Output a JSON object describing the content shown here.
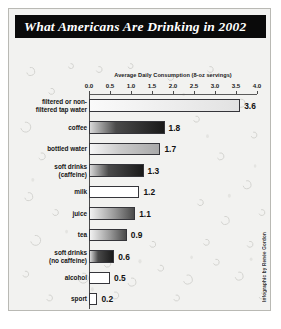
{
  "poster": {
    "title": "What Americans Are Drinking in 2002",
    "credit": "Infographic by Renée Gordon",
    "background_color": "#f2f2f0",
    "titlebar_color": "#0a0a0a",
    "title_text_color": "#ffffff"
  },
  "chart_data": {
    "type": "bar",
    "orientation": "horizontal",
    "title": "What Americans Are Drinking in 2002",
    "xlabel": "Average Daily Consumption (8-oz servings)",
    "ylabel": "",
    "xlim": [
      0.0,
      4.0
    ],
    "xticks": [
      "0.0",
      "0.5",
      "1.0",
      "1.5",
      "2.0",
      "2.5",
      "3.0",
      "3.5",
      "4.0"
    ],
    "grid": false,
    "legend": null,
    "categories": [
      "filtered or non-filtered tap water",
      "coffee",
      "bottled water",
      "soft drinks (caffeine)",
      "milk",
      "juice",
      "tea",
      "soft drinks (no caffeine)",
      "alcohol",
      "sport"
    ],
    "values": [
      3.6,
      1.8,
      1.7,
      1.3,
      1.2,
      1.1,
      0.9,
      0.6,
      0.5,
      0.2
    ],
    "value_labels": [
      "3.6",
      "1.8",
      "1.7",
      "1.3",
      "1.2",
      "1.1",
      "0.9",
      "0.6",
      "0.5",
      "0.2"
    ],
    "bars": [
      {
        "label": "filtered or non-filtered tap water",
        "label_lines": [
          "filtered or non-",
          "filtered tap water"
        ],
        "value": 3.6,
        "value_label": "3.6",
        "fill": "light",
        "height_px": 13
      },
      {
        "label": "coffee",
        "label_lines": [
          "coffee"
        ],
        "value": 1.8,
        "value_label": "1.8",
        "fill": "dark",
        "height_px": 13
      },
      {
        "label": "bottled water",
        "label_lines": [
          "bottled water"
        ],
        "value": 1.7,
        "value_label": "1.7",
        "fill": "medium",
        "height_px": 12
      },
      {
        "label": "soft drinks (caffeine)",
        "label_lines": [
          "soft drinks",
          "(caffeine)"
        ],
        "value": 1.3,
        "value_label": "1.3",
        "fill": "dark",
        "height_px": 13
      },
      {
        "label": "milk",
        "label_lines": [
          "milk"
        ],
        "value": 1.2,
        "value_label": "1.2",
        "fill": "white",
        "height_px": 12
      },
      {
        "label": "juice",
        "label_lines": [
          "juice"
        ],
        "value": 1.1,
        "value_label": "1.1",
        "fill": "gradient",
        "height_px": 13
      },
      {
        "label": "tea",
        "label_lines": [
          "tea"
        ],
        "value": 0.9,
        "value_label": "0.9",
        "fill": "gradient",
        "height_px": 12
      },
      {
        "label": "soft drinks (no caffeine)",
        "label_lines": [
          "soft drinks",
          "(no caffeine)"
        ],
        "value": 0.6,
        "value_label": "0.6",
        "fill": "dark",
        "height_px": 13
      },
      {
        "label": "alcohol",
        "label_lines": [
          "alcohol"
        ],
        "value": 0.5,
        "value_label": "0.5",
        "fill": "white",
        "height_px": 12
      },
      {
        "label": "sport",
        "label_lines": [
          "sport"
        ],
        "value": 0.2,
        "value_label": "0.2",
        "fill": "white",
        "height_px": 12
      }
    ]
  }
}
